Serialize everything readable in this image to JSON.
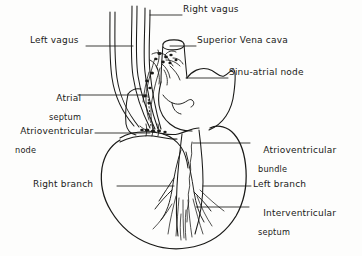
{
  "figure": {
    "style": "hand-drawn ink line diagram",
    "ink_color": "#1a1a18",
    "background_color": "#fdfdfc"
  },
  "labels": {
    "right_vagus": {
      "text": "Right vagus",
      "x": 183,
      "y": 10,
      "leader_to_x": 150,
      "leader_to_y": 15
    },
    "left_vagus": {
      "text": "Left vagus",
      "x": 30,
      "y": 41,
      "leader_to_x": 133,
      "leader_to_y": 46
    },
    "superior_vena_cava": {
      "text": "Superior Vena cava",
      "x": 196,
      "y": 41,
      "leader_to_x": 168,
      "leader_to_y": 46
    },
    "sinu_atrial_node": {
      "text": "Sinu-atrial node",
      "x": 228,
      "y": 72,
      "leader_to_x": 186,
      "leader_to_y": 78
    },
    "atrial_septum": {
      "line1": "Atrial",
      "line2": "septum",
      "x": 38,
      "y": 88,
      "leader_to_x": 147,
      "leader_to_y": 100
    },
    "atrioventricular_node": {
      "line1": "Atrioventricular",
      "line2": "node",
      "x": 10,
      "y": 120,
      "leader_to_x": 150,
      "leader_to_y": 134
    },
    "atrioventricular_bundle": {
      "line1": "Atrioventricular",
      "line2": "bundle",
      "x": 250,
      "y": 139,
      "leader_to_x": 193,
      "leader_to_y": 142
    },
    "right_branch": {
      "text": "Right branch",
      "x": 33,
      "y": 180,
      "leader_to_x": 172,
      "leader_to_y": 186
    },
    "left_branch": {
      "text": "Left branch",
      "x": 252,
      "y": 180,
      "leader_to_x": 200,
      "leader_to_y": 186
    },
    "interventricular_septum": {
      "line1": "Interventricular",
      "line2": "septum",
      "x": 250,
      "y": 201,
      "leader_to_x": 195,
      "leader_to_y": 207
    }
  },
  "structures": {
    "vagus_nerve_trunks": "four long parallel curved lines descending from top of figure",
    "superior_vena_cava": "vertical tube entering right atrium at top",
    "right_atrium": "rounded chamber upper right of figure",
    "atrial_septum": "dotted vertical line in atrium",
    "sinu_atrial_node": "dark plexus of nerve fibres at top of right atrium",
    "atrioventricular_node": "dark nodal mass at atrioventricular junction",
    "atrioventricular_bundle": "bundle running down interventricular septum",
    "right_branch": "conduction branch into right ventricle",
    "left_branch": "conduction branch into left ventricle",
    "interventricular_septum": "septum dividing the ventricles",
    "ventricles": "large pear-shaped chamber forming lower two-thirds of figure",
    "purkinje_fibres": "fine radiating fibres fanning toward the apex"
  }
}
